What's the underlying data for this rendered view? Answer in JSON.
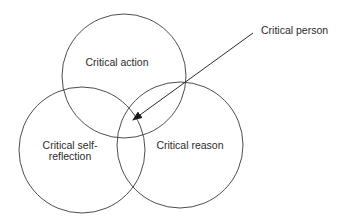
{
  "diagram": {
    "type": "venn",
    "colors": {
      "stroke": "#3a3a3a",
      "text": "#2b2b2b",
      "background": "#ffffff"
    },
    "circles": [
      {
        "id": "action",
        "label": "Critical action",
        "cx": 124,
        "cy": 76,
        "r": 62
      },
      {
        "id": "self-reflection",
        "label_line1": "Critical self-",
        "label_line2": "reflection",
        "cx": 82,
        "cy": 150,
        "r": 63
      },
      {
        "id": "reason",
        "label": "Critical reason",
        "cx": 180,
        "cy": 145,
        "r": 63
      }
    ],
    "callout": {
      "label": "Critical person",
      "arrow_from": [
        253,
        33
      ],
      "arrow_to": [
        133,
        120
      ]
    }
  }
}
